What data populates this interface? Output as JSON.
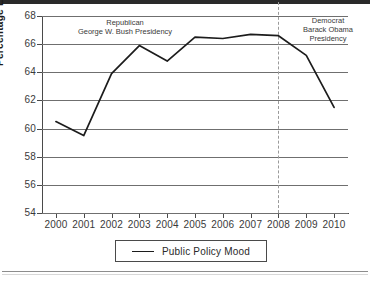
{
  "chart_data": {
    "type": "line",
    "title": "",
    "xlabel": "",
    "ylabel": "Percentage Liberal",
    "categories": [
      "2000",
      "2001",
      "2002",
      "2003",
      "2004",
      "2005",
      "2006",
      "2007",
      "2008",
      "2009",
      "2010"
    ],
    "x": [
      2000,
      2001,
      2002,
      2003,
      2004,
      2005,
      2006,
      2007,
      2008,
      2009,
      2010
    ],
    "series": [
      {
        "name": "Public Policy Mood",
        "color": "#1c1c1c",
        "values": [
          60.5,
          59.5,
          63.9,
          65.9,
          64.8,
          66.5,
          66.4,
          66.7,
          66.6,
          65.2,
          61.5
        ]
      }
    ],
    "ylim": [
      54,
      68
    ],
    "xlim": [
      1999.5,
      2010.5
    ],
    "yticks": [
      54,
      56,
      58,
      60,
      62,
      64,
      66,
      68
    ],
    "ytick_labels": [
      "54",
      "56",
      "58",
      "60",
      "62",
      "64",
      "66",
      "68"
    ],
    "grid": true,
    "grid_axis": "y",
    "legend_position": "below-center",
    "annotations": [
      {
        "name": "republican-bush-annotation",
        "lines": [
          "Republican",
          "George W. Bush Presidency"
        ],
        "x_span": [
          2000,
          2008
        ]
      },
      {
        "name": "democrat-obama-annotation",
        "lines": [
          "Democrat",
          "Barack Obama",
          "Presidency"
        ],
        "x_span": [
          2008,
          2010
        ]
      }
    ],
    "vertical_markers": [
      {
        "name": "presidency-divider",
        "x": 2008,
        "style": "dashed",
        "color": "#9a9a9a"
      }
    ]
  },
  "legend": {
    "label": "Public Policy Mood"
  },
  "axes": {
    "y_title": "Percentage Liberal"
  }
}
